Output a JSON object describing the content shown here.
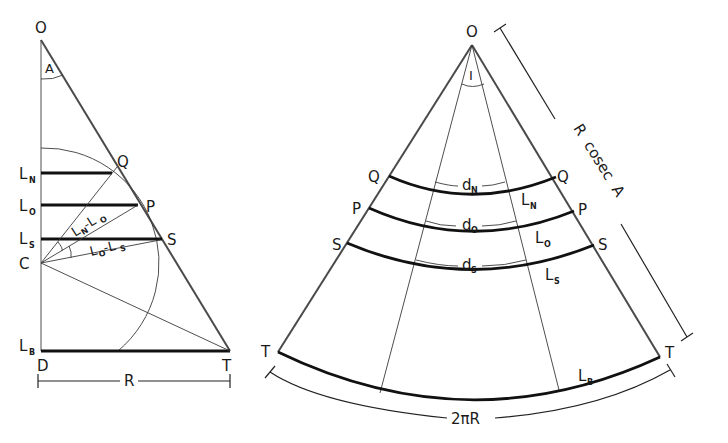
{
  "figure": {
    "left_panel": {
      "vertices": {
        "apex": "O",
        "center": "C",
        "foot": "D",
        "tip": "T"
      },
      "angle_label": "A",
      "points_on_hypotenuse": [
        "Q",
        "P",
        "S"
      ],
      "level_lines": [
        {
          "label": "L",
          "subscript": "N"
        },
        {
          "label": "L",
          "subscript": "O"
        },
        {
          "label": "L",
          "subscript": "S"
        },
        {
          "label": "L",
          "subscript": "B"
        }
      ],
      "angle_annotations": [
        {
          "text": "L",
          "sub": "N",
          "mid": "-L",
          "sub2": "O"
        },
        {
          "text": "L",
          "sub": "O",
          "mid": "-L",
          "sub2": "S"
        }
      ],
      "base_dimension": "R"
    },
    "right_panel": {
      "apex": "O",
      "angle_label": "I",
      "edge_points_left": [
        "Q",
        "P",
        "S",
        "T"
      ],
      "edge_points_right": [
        "Q",
        "P",
        "S",
        "T"
      ],
      "arc_labels": [
        {
          "label": "L",
          "subscript": "N"
        },
        {
          "label": "L",
          "subscript": "O"
        },
        {
          "label": "L",
          "subscript": "S"
        },
        {
          "label": "L",
          "subscript": "B"
        }
      ],
      "chord_labels": [
        {
          "label": "d",
          "subscript": "N"
        },
        {
          "label": "d",
          "subscript": "O"
        },
        {
          "label": "d",
          "subscript": "S"
        }
      ],
      "slant_dimension": "R  cosec  A",
      "arc_dimension": "2πR"
    },
    "colors": {
      "ink": "#111111",
      "background": "#ffffff"
    }
  }
}
